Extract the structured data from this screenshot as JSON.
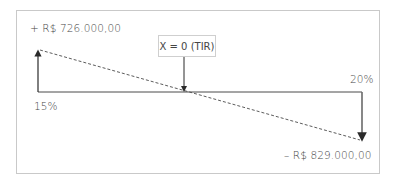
{
  "diagram": {
    "type": "irr-cash-flow",
    "top_value_label": "+ R$ 726.000,00",
    "bottom_value_label": "– R$ 829.000,00",
    "tir_label": "X = 0 (TIR)",
    "left_rate_label": "15%",
    "right_rate_label": "20%",
    "colors": {
      "frame_border": "#c9c9c9",
      "lines": "#3a3a3a",
      "right_arrow": "#6a6a6a",
      "text": "#454545"
    }
  }
}
